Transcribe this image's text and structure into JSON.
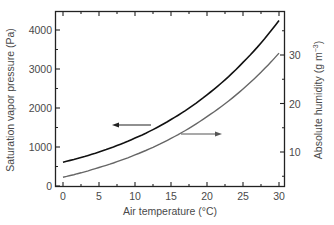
{
  "chart_data": {
    "type": "line",
    "title": "",
    "xlabel": "Air temperature (°C)",
    "ylabel": "Saturation vapor pressure (Pa)",
    "y2label": "Absolute humidity (g m⁻³)",
    "xlim": [
      -1,
      31
    ],
    "ylim": [
      0,
      4500
    ],
    "y2lim": [
      2,
      38
    ],
    "grid": false,
    "legend": "none (arrows indicate axis for each curve)",
    "x_ticks": [
      0,
      5,
      10,
      15,
      20,
      25,
      30
    ],
    "y_ticks": [
      0,
      1000,
      2000,
      3000,
      4000
    ],
    "y2_ticks": [
      10,
      20,
      30
    ],
    "x": [
      0,
      5,
      10,
      15,
      20,
      25,
      30
    ],
    "series": [
      {
        "name": "Saturation vapor pressure",
        "axis": "left",
        "color": "#111111",
        "values": [
          611,
          872,
          1228,
          1705,
          2338,
          3169,
          4246
        ]
      },
      {
        "name": "Absolute humidity",
        "axis": "right",
        "color": "#666666",
        "values": [
          4.8,
          6.8,
          9.4,
          12.8,
          17.3,
          23.0,
          30.4
        ]
      }
    ],
    "annotations": [
      {
        "type": "arrow",
        "direction": "left",
        "points_to": "left axis",
        "near_series": "Saturation vapor pressure"
      },
      {
        "type": "arrow",
        "direction": "right",
        "points_to": "right axis",
        "near_series": "Absolute humidity"
      }
    ]
  },
  "labels": {
    "x_axis": "Air temperature (°C)",
    "y_axis": "Saturation vapor pressure (Pa)",
    "y2_axis_main": "Absolute humidity (g m",
    "y2_axis_sup": "−3",
    "y2_axis_end": ")"
  },
  "ticks": {
    "x": [
      "0",
      "5",
      "10",
      "15",
      "20",
      "25",
      "30"
    ],
    "y": [
      "0",
      "1000",
      "2000",
      "3000",
      "4000"
    ],
    "y2": [
      "10",
      "20",
      "30"
    ]
  }
}
